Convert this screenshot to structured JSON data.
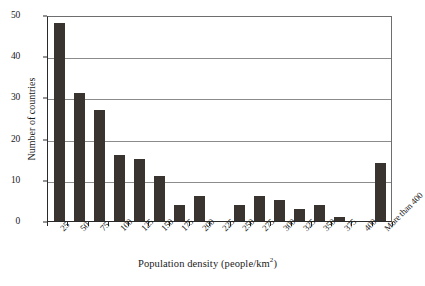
{
  "chart_data": {
    "type": "bar",
    "title": "",
    "xlabel": "Population density (people/km2)",
    "xlabel_base": "Population density (people/km",
    "xlabel_sup": "2",
    "xlabel_tail": ")",
    "ylabel": "Number of countries",
    "categories": [
      "25",
      "50",
      "75",
      "100",
      "125",
      "150",
      "175",
      "200",
      "225",
      "250",
      "275",
      "300",
      "325",
      "350",
      "375",
      "400",
      "More than 400"
    ],
    "values": [
      48,
      31,
      27,
      16,
      15,
      11,
      4,
      6,
      0,
      4,
      6,
      5,
      3,
      4,
      1,
      0,
      14
    ],
    "ylim": [
      0,
      50
    ],
    "yticks": [
      0,
      10,
      20,
      30,
      40,
      50
    ],
    "ytick_labels": [
      "0",
      "10",
      "20",
      "30",
      "40",
      "50"
    ],
    "grid": "horizontal",
    "legend": "none",
    "bar_color": "#3a3430",
    "gridline_color": "#8c8c8c",
    "axis_color": "#2a2a2a",
    "background": "#ffffff"
  }
}
